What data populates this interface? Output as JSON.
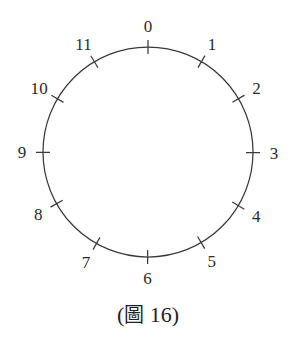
{
  "figure": {
    "caption": "(圖 16)",
    "caption_prefix": "(",
    "caption_cjk": "圖",
    "caption_number": "16",
    "caption_suffix": ")",
    "background_color": "#ffffff",
    "stroke_color": "#3a3a3a",
    "label_color": "#2b2b2b"
  },
  "circle": {
    "center_x": 148,
    "center_y": 152,
    "radius": 105,
    "tick_inner_offset": 7,
    "tick_outer_offset": 7,
    "label_radius": 126,
    "tick_count": 12,
    "start_angle_deg": -90,
    "direction": "clockwise"
  },
  "chart_data": {
    "type": "scatter",
    "xlabel": "",
    "ylabel": "",
    "categories": [
      "0",
      "1",
      "2",
      "3",
      "4",
      "5",
      "6",
      "7",
      "8",
      "9",
      "10",
      "11"
    ],
    "values": [
      0,
      1,
      2,
      3,
      4,
      5,
      6,
      7,
      8,
      9,
      10,
      11
    ],
    "angles_deg": [
      0,
      30,
      60,
      90,
      120,
      150,
      180,
      210,
      240,
      270,
      300,
      330
    ],
    "grid": false,
    "legend": false
  },
  "labels": [
    {
      "text": "0",
      "angle_deg": 0,
      "anchor": "center-below-top"
    },
    {
      "text": "1",
      "angle_deg": 30,
      "anchor": "upper-right"
    },
    {
      "text": "2",
      "angle_deg": 60,
      "anchor": "right-upper"
    },
    {
      "text": "3",
      "angle_deg": 90,
      "anchor": "right"
    },
    {
      "text": "4",
      "angle_deg": 120,
      "anchor": "right-lower"
    },
    {
      "text": "5",
      "angle_deg": 150,
      "anchor": "lower-right"
    },
    {
      "text": "6",
      "angle_deg": 180,
      "anchor": "center-below-bottom"
    },
    {
      "text": "7",
      "angle_deg": 210,
      "anchor": "lower-left"
    },
    {
      "text": "8",
      "angle_deg": 240,
      "anchor": "left-lower"
    },
    {
      "text": "9",
      "angle_deg": 270,
      "anchor": "left"
    },
    {
      "text": "10",
      "angle_deg": 300,
      "anchor": "left-upper"
    },
    {
      "text": "11",
      "angle_deg": 330,
      "anchor": "upper-left"
    }
  ]
}
